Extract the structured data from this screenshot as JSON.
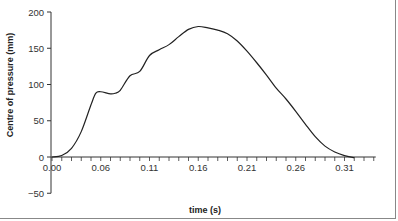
{
  "chart_data": {
    "type": "line",
    "title": "",
    "xlabel": "time (s)",
    "ylabel": "Centre of pressure (mm)",
    "xlim": [
      0.0,
      0.33
    ],
    "ylim": [
      -50,
      200
    ],
    "grid": false,
    "legend": null,
    "x_tick_labels": [
      "0.00",
      "0.06",
      "0.11",
      "0.16",
      "0.21",
      "0.26",
      "0.31"
    ],
    "x_tick_values": [
      0.0,
      0.05,
      0.1,
      0.15,
      0.2,
      0.25,
      0.3
    ],
    "y_tick_labels": [
      "200",
      "150",
      "100",
      "50",
      "0",
      "−50"
    ],
    "y_tick_values": [
      200,
      150,
      100,
      50,
      0,
      -50
    ],
    "series": [
      {
        "name": "Centre of pressure",
        "color": "#222222",
        "x": [
          0.0,
          0.01,
          0.02,
          0.03,
          0.04,
          0.045,
          0.05,
          0.06,
          0.065,
          0.07,
          0.08,
          0.09,
          0.1,
          0.11,
          0.12,
          0.13,
          0.14,
          0.15,
          0.16,
          0.17,
          0.18,
          0.19,
          0.2,
          0.21,
          0.22,
          0.23,
          0.24,
          0.25,
          0.26,
          0.27,
          0.28,
          0.29,
          0.3,
          0.31
        ],
        "values": [
          0,
          2,
          12,
          35,
          72,
          88,
          90,
          87,
          88,
          92,
          112,
          118,
          140,
          148,
          155,
          166,
          176,
          180,
          178,
          175,
          170,
          160,
          146,
          130,
          113,
          95,
          80,
          63,
          45,
          28,
          15,
          7,
          2,
          -1
        ]
      }
    ]
  }
}
